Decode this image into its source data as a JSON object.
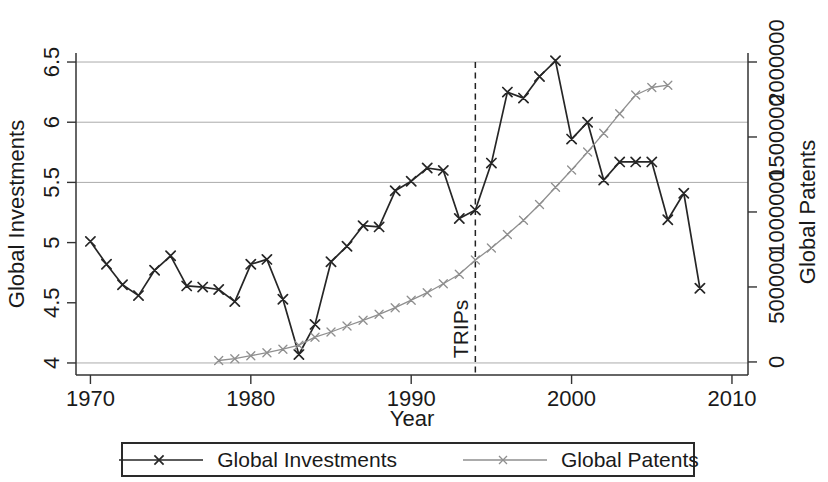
{
  "colors": {
    "investments_line": "#262626",
    "patents_line": "#8f8f8f",
    "gridline": "#ababab",
    "axis": "#333333",
    "text": "#1a1a1a",
    "background": "#ffffff"
  },
  "chart_data": {
    "type": "line",
    "title": "",
    "xlabel": "Year",
    "x_ticks": [
      1970,
      1980,
      1990,
      2000,
      2010
    ],
    "x_tick_labels": [
      "1970",
      "1980",
      "1990",
      "2000",
      "2010"
    ],
    "x_range": [
      1969.1,
      2011
    ],
    "grid": "horizontal",
    "y_left": {
      "label": "Global Investments",
      "ticks": [
        4,
        4.5,
        5,
        5.5,
        6,
        6.5
      ],
      "tick_labels": [
        "4",
        "4.5",
        "5",
        "5.5",
        "6",
        "6.5"
      ],
      "range": [
        3.9,
        6.575
      ],
      "gridline_values": [
        4,
        5.5,
        6,
        6.5
      ]
    },
    "y_right": {
      "label": "Global Patents",
      "ticks": [
        0,
        500000,
        1000000,
        1500000,
        2000000
      ],
      "tick_labels": [
        "0",
        "500000",
        "1000000",
        "1500000",
        "2000000"
      ],
      "range": [
        -87000,
        2060000
      ]
    },
    "vline": {
      "x": 1994,
      "label": "TRIPs",
      "style": "dashed",
      "color": "#222222"
    },
    "legend": {
      "position": "bottom",
      "border": true
    },
    "series": [
      {
        "name": "Global Investments",
        "axis": "left",
        "color": "#262626",
        "marker": "x",
        "marker_size": 4.6,
        "line_width": 1.7,
        "x": [
          1970,
          1971,
          1972,
          1973,
          1974,
          1975,
          1976,
          1977,
          1978,
          1979,
          1980,
          1981,
          1982,
          1983,
          1984,
          1985,
          1986,
          1987,
          1988,
          1989,
          1990,
          1991,
          1992,
          1993,
          1994,
          1995,
          1996,
          1997,
          1998,
          1999,
          2000,
          2001,
          2002,
          2003,
          2004,
          2005,
          2006,
          2007,
          2008
        ],
        "values": [
          5.01,
          4.82,
          4.65,
          4.56,
          4.77,
          4.89,
          4.64,
          4.63,
          4.61,
          4.51,
          4.82,
          4.86,
          4.53,
          4.07,
          4.32,
          4.84,
          4.97,
          5.14,
          5.13,
          5.43,
          5.51,
          5.62,
          5.6,
          5.2,
          5.27,
          5.66,
          6.25,
          6.2,
          6.38,
          6.51,
          5.86,
          6.0,
          5.52,
          5.67,
          5.67,
          5.67,
          5.19,
          5.41,
          4.62
        ]
      },
      {
        "name": "Global Patents",
        "axis": "right",
        "color": "#8f8f8f",
        "marker": "x",
        "marker_size": 4.0,
        "line_width": 1.3,
        "x": [
          1978,
          1979,
          1980,
          1981,
          1982,
          1983,
          1984,
          1985,
          1986,
          1987,
          1988,
          1989,
          1990,
          1991,
          1992,
          1993,
          1994,
          1995,
          1996,
          1997,
          1998,
          1999,
          2000,
          2001,
          2002,
          2003,
          2004,
          2005,
          2006
        ],
        "values": [
          10000,
          22000,
          42000,
          62000,
          85000,
          112000,
          165000,
          200000,
          240000,
          278000,
          318000,
          362000,
          412000,
          462000,
          522000,
          585000,
          680000,
          760000,
          850000,
          945000,
          1050000,
          1165000,
          1280000,
          1400000,
          1525000,
          1655000,
          1780000,
          1830000,
          1845000
        ]
      }
    ]
  }
}
